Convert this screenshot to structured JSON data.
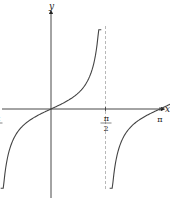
{
  "chart_data": {
    "type": "line",
    "title": "",
    "function": "y = tan(x)",
    "xlabel": "x",
    "ylabel": "y",
    "x_ticks": [
      {
        "value": -1.5708,
        "label": "-π/2",
        "num": "π",
        "den": "2",
        "sign": "−",
        "coef": ""
      },
      {
        "value": 1.5708,
        "label": "π/2",
        "num": "π",
        "den": "2",
        "sign": "",
        "coef": ""
      },
      {
        "value": 3.1416,
        "label": "π",
        "num": "π",
        "den": "",
        "sign": "",
        "coef": ""
      },
      {
        "value": 4.7124,
        "label": "3π/2",
        "num": "π",
        "den": "2",
        "sign": "",
        "coef": "3"
      }
    ],
    "asymptotes": [
      -1.5708,
      1.5708,
      4.7124
    ],
    "asymptote_style": "dashed",
    "xlim": [
      -1.9,
      5.9
    ],
    "ylim": [
      -3.5,
      4.0
    ],
    "grid": false,
    "legend": null,
    "series": [
      {
        "name": "tan(x) branch 1",
        "domain": [
          -1.45,
          1.45
        ]
      },
      {
        "name": "tan(x) branch 2",
        "domain": [
          1.69,
          4.59
        ]
      }
    ],
    "colors": {
      "curve": "#444444",
      "axis": "#333333",
      "asymptote": "#999999"
    }
  }
}
